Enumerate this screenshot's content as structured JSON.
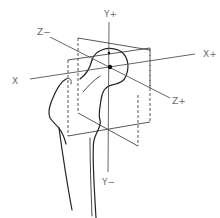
{
  "figure": {
    "labels": {
      "y_plus": "Y+",
      "y_minus": "Y−",
      "x_plus": "X+",
      "x_minus": "X",
      "z_minus": "Z−",
      "z_plus": "Z+"
    },
    "colors": {
      "line": "#222222",
      "label": "#6a6a6a",
      "background": "#ffffff"
    }
  }
}
